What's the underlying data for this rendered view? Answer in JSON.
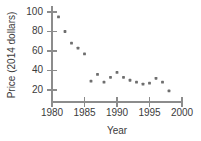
{
  "chart_data": {
    "type": "scatter",
    "title": "",
    "xlabel": "Year",
    "ylabel": "Price (2014 dollars)",
    "xlim": [
      1980,
      2000
    ],
    "ylim": [
      10,
      105
    ],
    "xticks": [
      1980,
      1985,
      1990,
      1995,
      2000
    ],
    "yticks": [
      20,
      40,
      60,
      80,
      100
    ],
    "grid": false,
    "legend": null,
    "marker": "square-dot",
    "marker_color": "#6e6e6e",
    "axis_color": "#8c8c8c",
    "x": [
      1981,
      1982,
      1983,
      1984,
      1985,
      1986,
      1987,
      1988,
      1989,
      1990,
      1991,
      1992,
      1993,
      1994,
      1995,
      1996,
      1997,
      1998
    ],
    "values": [
      95,
      80,
      68,
      63,
      57,
      29,
      36,
      28,
      33,
      38,
      33,
      30,
      28,
      26,
      27,
      32,
      28,
      19
    ],
    "points": [
      {
        "x": 1981,
        "y": 95
      },
      {
        "x": 1982,
        "y": 80
      },
      {
        "x": 1983,
        "y": 68
      },
      {
        "x": 1984,
        "y": 63
      },
      {
        "x": 1985,
        "y": 57
      },
      {
        "x": 1986,
        "y": 29
      },
      {
        "x": 1987,
        "y": 36
      },
      {
        "x": 1988,
        "y": 28
      },
      {
        "x": 1989,
        "y": 33
      },
      {
        "x": 1990,
        "y": 38
      },
      {
        "x": 1991,
        "y": 33
      },
      {
        "x": 1992,
        "y": 30
      },
      {
        "x": 1993,
        "y": 28
      },
      {
        "x": 1994,
        "y": 26
      },
      {
        "x": 1995,
        "y": 27
      },
      {
        "x": 1996,
        "y": 32
      },
      {
        "x": 1997,
        "y": 28
      },
      {
        "x": 1998,
        "y": 19
      }
    ]
  },
  "axes": {
    "y_tick_labels": [
      "100",
      "80",
      "60",
      "40",
      "20"
    ],
    "x_tick_labels": [
      "1980",
      "1985",
      "1990",
      "1995",
      "2000"
    ],
    "x_axis_title": "Year",
    "y_axis_title": "Price (2014 dollars)"
  }
}
